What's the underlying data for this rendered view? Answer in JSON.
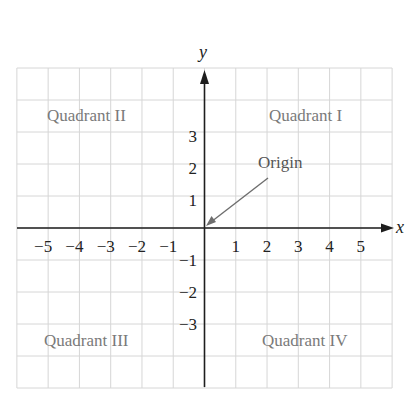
{
  "diagram": {
    "axes": {
      "x_label": "x",
      "y_label": "y",
      "x_ticks": [
        "−5",
        "−4",
        "−3",
        "−2",
        "−1",
        "1",
        "2",
        "3",
        "4",
        "5"
      ],
      "x_tick_values": [
        -5,
        -4,
        -3,
        -2,
        -1,
        1,
        2,
        3,
        4,
        5
      ],
      "y_ticks": [
        "3",
        "2",
        "1",
        "−1",
        "−2",
        "−3"
      ],
      "y_tick_values": [
        3,
        2,
        1,
        -1,
        -2,
        -3
      ]
    },
    "grid": {
      "x_range": [
        -6,
        6
      ],
      "y_range": [
        -5,
        5
      ],
      "visible": true
    },
    "quadrants": {
      "q1": "Quadrant I",
      "q2": "Quadrant II",
      "q3": "Quadrant III",
      "q4": "Quadrant IV"
    },
    "annotation": {
      "label": "Origin",
      "points_to": [
        0,
        0
      ]
    },
    "colors": {
      "grid": "#d6d6d6",
      "axes": "#1e1e1e",
      "quadrant_text": "#7a7a7a",
      "pointer": "#6e6e6e"
    }
  }
}
